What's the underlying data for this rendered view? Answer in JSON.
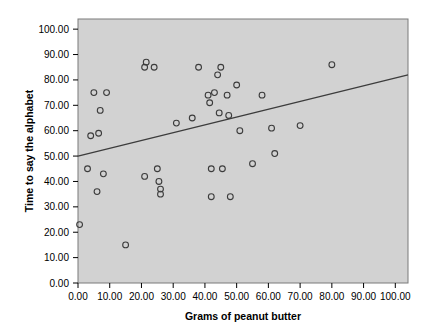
{
  "chart_data": {
    "type": "scatter",
    "title": "",
    "xlabel": "Grams of peanut butter",
    "ylabel": "Time to say the alphabet",
    "xlim": [
      0,
      104
    ],
    "ylim": [
      0,
      104
    ],
    "xticks": [
      "0.00",
      "10.00",
      "20.00",
      "30.00",
      "40.00",
      "50.00",
      "60.00",
      "70.00",
      "80.00",
      "90.00",
      "100.00"
    ],
    "xtick_values": [
      0,
      10,
      20,
      30,
      40,
      50,
      60,
      70,
      80,
      90,
      100
    ],
    "yticks": [
      "0.00",
      "10.00",
      "20.00",
      "30.00",
      "40.00",
      "50.00",
      "60.00",
      "70.00",
      "80.00",
      "90.00",
      "100.00"
    ],
    "ytick_values": [
      0,
      10,
      20,
      30,
      40,
      50,
      60,
      70,
      80,
      90,
      100
    ],
    "grid": false,
    "legend": "none",
    "plot_background": "#d2d2d2",
    "marker_color": "#3c3c3c",
    "line_color": "#3c3c3c",
    "points": [
      {
        "x": 0.5,
        "y": 23
      },
      {
        "x": 3,
        "y": 45
      },
      {
        "x": 4,
        "y": 58
      },
      {
        "x": 5,
        "y": 75
      },
      {
        "x": 6,
        "y": 36
      },
      {
        "x": 6.5,
        "y": 59
      },
      {
        "x": 7,
        "y": 68
      },
      {
        "x": 8,
        "y": 43
      },
      {
        "x": 9,
        "y": 75
      },
      {
        "x": 15,
        "y": 15
      },
      {
        "x": 21,
        "y": 85
      },
      {
        "x": 21.5,
        "y": 87
      },
      {
        "x": 21,
        "y": 42
      },
      {
        "x": 24,
        "y": 85
      },
      {
        "x": 25,
        "y": 45
      },
      {
        "x": 25.5,
        "y": 40
      },
      {
        "x": 26,
        "y": 37
      },
      {
        "x": 26,
        "y": 35
      },
      {
        "x": 31,
        "y": 63
      },
      {
        "x": 36,
        "y": 65
      },
      {
        "x": 38,
        "y": 85
      },
      {
        "x": 41,
        "y": 74
      },
      {
        "x": 41.5,
        "y": 71
      },
      {
        "x": 42,
        "y": 45
      },
      {
        "x": 42,
        "y": 34
      },
      {
        "x": 43,
        "y": 75
      },
      {
        "x": 44,
        "y": 82
      },
      {
        "x": 44.5,
        "y": 67
      },
      {
        "x": 45,
        "y": 85
      },
      {
        "x": 45.5,
        "y": 45
      },
      {
        "x": 47,
        "y": 74
      },
      {
        "x": 47.5,
        "y": 66
      },
      {
        "x": 48,
        "y": 34
      },
      {
        "x": 50,
        "y": 78
      },
      {
        "x": 51,
        "y": 60
      },
      {
        "x": 55,
        "y": 47
      },
      {
        "x": 58,
        "y": 74
      },
      {
        "x": 61,
        "y": 61
      },
      {
        "x": 62,
        "y": 51
      },
      {
        "x": 70,
        "y": 62
      },
      {
        "x": 80,
        "y": 86
      }
    ],
    "trendline": {
      "x0": 0,
      "y0": 50,
      "x1": 104,
      "y1": 82,
      "description": "linear fit"
    }
  }
}
